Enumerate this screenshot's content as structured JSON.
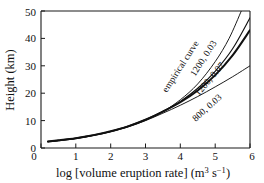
{
  "chart_data": {
    "type": "line",
    "title": "",
    "xlabel": "log [volume eruption rate] (m3 s-1)",
    "xlabel_main": "log [volume eruption rate] (m",
    "xlabel_sup1": "3",
    "xlabel_mid": " s",
    "xlabel_sup2": "−1",
    "xlabel_end": ")",
    "ylabel": "Height (km)",
    "xlim": [
      0,
      6
    ],
    "ylim": [
      0,
      50
    ],
    "xticks": [
      "0",
      "1",
      "2",
      "3",
      "4",
      "5",
      "6"
    ],
    "yticks": [
      "0",
      "10",
      "20",
      "30",
      "40",
      "50"
    ],
    "grid": false,
    "legend_position": "inline-curve-labels",
    "series": [
      {
        "name": "empirical curve",
        "label": "empirical curve",
        "style": "thin",
        "x": [
          0.2,
          0.5,
          1.0,
          1.5,
          2.0,
          2.5,
          3.0,
          3.5,
          4.0,
          4.5,
          5.0,
          5.4,
          5.75
        ],
        "y": [
          2.3,
          2.7,
          3.5,
          4.6,
          6.0,
          7.8,
          10.2,
          13.3,
          17.6,
          23.4,
          31.5,
          40.0,
          50.0
        ]
      },
      {
        "name": "1200, 0.03",
        "label": "1200, 0.03",
        "style": "medium",
        "x": [
          0.2,
          0.5,
          1.0,
          1.5,
          2.0,
          2.5,
          3.0,
          3.5,
          4.0,
          4.5,
          5.0,
          5.5,
          6.0
        ],
        "y": [
          2.4,
          2.8,
          3.6,
          4.7,
          6.1,
          8.0,
          10.4,
          13.4,
          17.0,
          21.8,
          28.0,
          36.2,
          47.5
        ]
      },
      {
        "name": "1200, 0.07",
        "label": "1200, 0.07",
        "style": "bold",
        "x": [
          0.2,
          0.5,
          1.0,
          1.5,
          2.0,
          2.5,
          3.0,
          3.5,
          4.0,
          4.5,
          5.0,
          5.5,
          6.0
        ],
        "y": [
          2.4,
          2.8,
          3.6,
          4.7,
          6.1,
          7.9,
          10.3,
          13.3,
          16.7,
          21.0,
          26.6,
          33.8,
          43.0
        ]
      },
      {
        "name": "800, 0.03",
        "label": "800, 0.03",
        "style": "thin",
        "x": [
          0.2,
          0.5,
          1.0,
          1.5,
          2.0,
          2.5,
          3.0,
          3.5,
          4.0,
          4.5,
          5.0,
          5.5,
          6.0
        ],
        "y": [
          2.2,
          2.6,
          3.4,
          4.5,
          5.9,
          7.7,
          10.0,
          12.7,
          15.6,
          18.8,
          22.3,
          26.0,
          30.0
        ]
      }
    ],
    "curve_labels": [
      {
        "text": "empirical curve",
        "x": 183,
        "y": 68,
        "rotate": -57
      },
      {
        "text": "1200, 0.03",
        "x": 206,
        "y": 60,
        "rotate": -57
      },
      {
        "text": "1200, 0.07",
        "x": 212,
        "y": 81,
        "rotate": -50
      },
      {
        "text": "800, 0.03",
        "x": 209,
        "y": 110,
        "rotate": -42
      }
    ]
  },
  "colors": {
    "axis": "#1a1a1a",
    "curve": "#111111",
    "background": "#ffffff"
  }
}
